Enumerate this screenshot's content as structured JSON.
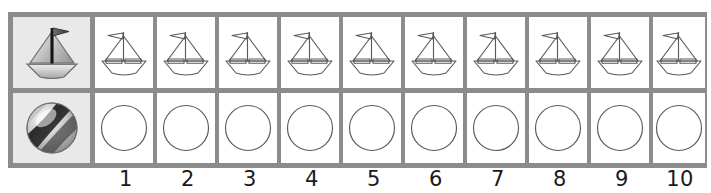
{
  "worksheet": {
    "title": "Counting worksheet: sailboats and balls",
    "columns": 10,
    "rows": [
      {
        "row_id": "sailboat-row",
        "header_icon": "sailboat-icon",
        "cell_icon": "sailboat-outline-icon",
        "cell_count": 10
      },
      {
        "row_id": "ball-row",
        "header_icon": "beach-ball-icon",
        "cell_icon": "circle-outline-icon",
        "cell_count": 10
      }
    ],
    "number_labels": [
      "1",
      "2",
      "3",
      "4",
      "5",
      "6",
      "7",
      "8",
      "9",
      "10"
    ],
    "colors": {
      "grid_line": "#8c8c8c",
      "header_fill": "#e9e9e9",
      "cell_fill": "#ffffff",
      "icon_stroke": "#555555",
      "number_text": "#1a1a1a"
    }
  }
}
